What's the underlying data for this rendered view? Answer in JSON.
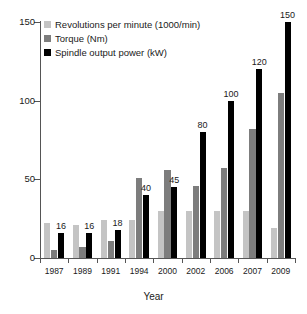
{
  "chart_data": {
    "type": "bar",
    "title": "",
    "xlabel": "Year",
    "ylabel": "",
    "ylim": [
      0,
      150
    ],
    "yticks": [
      0,
      50,
      100,
      150
    ],
    "grid": false,
    "legend_position": "top-left",
    "categories": [
      "1987",
      "1989",
      "1991",
      "1994",
      "2000",
      "2002",
      "2006",
      "2007",
      "2009"
    ],
    "series": [
      {
        "name": "Revolutions per minute (1000/min)",
        "color": "#c4c4c4",
        "values": [
          22,
          21,
          24,
          24,
          30,
          30,
          30,
          30,
          19
        ],
        "labels": [
          "",
          "",
          "",
          "",
          "",
          "",
          "",
          "",
          ""
        ]
      },
      {
        "name": "Torque (Nm)",
        "color": "#7d7d7d",
        "values": [
          5,
          7,
          11,
          51,
          56,
          46,
          57,
          82,
          105
        ],
        "labels": [
          "",
          "",
          "",
          "",
          "",
          "",
          "",
          "",
          ""
        ]
      },
      {
        "name": "Spindle output power (kW)",
        "color": "#000000",
        "values": [
          16,
          16,
          18,
          40,
          45,
          80,
          100,
          120,
          150
        ],
        "labels": [
          "16",
          "16",
          "18",
          "40",
          "45",
          "80",
          "100",
          "120",
          "150"
        ]
      }
    ]
  }
}
